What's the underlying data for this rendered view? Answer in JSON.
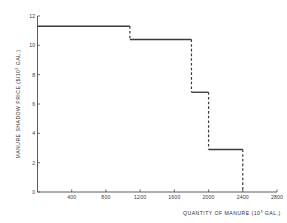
{
  "chart_data": {
    "type": "line",
    "subtype": "step",
    "title": "",
    "xlabel": "QUANTITY OF MANURE (10³ GAL.)",
    "xlabel_base": "QUANTITY OF MANURE (10",
    "xlabel_exponent": "3",
    "xlabel_tail": " GAL.)",
    "ylabel": "MANURE SHADOW PRICE ($/10³ GAL.)",
    "ylabel_base": "MANURE SHADOW PRICE ($/10",
    "ylabel_exponent": "3",
    "ylabel_tail": " GAL.)",
    "xlim": [
      0,
      2800
    ],
    "ylim": [
      0,
      12
    ],
    "xticks": [
      400,
      800,
      1200,
      1600,
      2000,
      2400,
      2800
    ],
    "xtick_labels": [
      "400",
      "800",
      "1200",
      "1600",
      "2000",
      "2400",
      "2800"
    ],
    "yticks": [
      0,
      2,
      4,
      6,
      8,
      10,
      12
    ],
    "ytick_labels": [
      "0",
      "2",
      "4",
      "6",
      "8",
      "10",
      "12"
    ],
    "grid": false,
    "legend": false,
    "line_color": "#3a3a3a",
    "axis_color": "#4a4a4a",
    "steps": [
      {
        "x_start": 0,
        "x_end": 1080,
        "y": 11.3
      },
      {
        "x_start": 1080,
        "x_end": 1800,
        "y": 10.4
      },
      {
        "x_start": 1800,
        "x_end": 2000,
        "y": 6.8
      },
      {
        "x_start": 2000,
        "x_end": 2400,
        "y": 2.9
      }
    ],
    "drops": [
      {
        "x": 1080,
        "y_from": 11.3,
        "y_to": 10.4
      },
      {
        "x": 1800,
        "y_from": 10.4,
        "y_to": 6.8
      },
      {
        "x": 2000,
        "y_from": 6.8,
        "y_to": 2.9
      },
      {
        "x": 2400,
        "y_from": 2.9,
        "y_to": 0.0
      }
    ],
    "x": [
      0,
      1080,
      1080,
      1800,
      1800,
      2000,
      2000,
      2400,
      2400
    ],
    "y": [
      11.3,
      11.3,
      10.4,
      10.4,
      6.8,
      6.8,
      2.9,
      2.9,
      0.0
    ]
  }
}
